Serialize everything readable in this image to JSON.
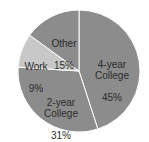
{
  "chart_data": {
    "type": "pie",
    "title": "",
    "categories": [
      "4-year College",
      "2-year College",
      "Work",
      "Other"
    ],
    "values": [
      45,
      31,
      9,
      15
    ],
    "unit": "%",
    "colors": [
      "#8c8c8c",
      "#8c8c8c",
      "#c8c8c8",
      "#8c8c8c"
    ],
    "start_angle_deg": 0,
    "direction": "clockwise",
    "labels": [
      {
        "name": "4-year\nCollege",
        "pct": "45%"
      },
      {
        "name": "2-year\nCollege",
        "pct": "31%"
      },
      {
        "name": "Work",
        "pct": "9%"
      },
      {
        "name": "Other",
        "pct": "15%"
      }
    ]
  }
}
